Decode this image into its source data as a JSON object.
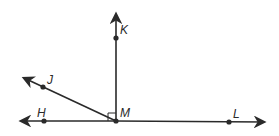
{
  "diagram": {
    "type": "geometry-rays",
    "points": {
      "M": {
        "label": "M",
        "x": 116,
        "y": 121
      },
      "K": {
        "label": "K",
        "x": 116,
        "y": 38
      },
      "J": {
        "label": "J",
        "x": 43,
        "y": 87
      },
      "H": {
        "label": "H",
        "x": 44,
        "y": 121
      },
      "L": {
        "label": "L",
        "x": 229,
        "y": 122
      }
    },
    "rays": [
      "MK",
      "MJ",
      "MH",
      "ML"
    ],
    "right_angle_at": "M",
    "right_angle_between": [
      "MK",
      "MH"
    ],
    "line_color": "#2a2a2a"
  }
}
